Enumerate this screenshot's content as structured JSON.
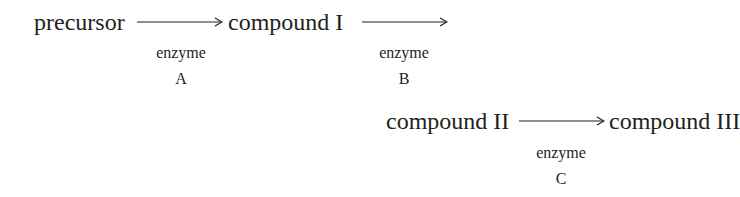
{
  "nodes": {
    "precursor": "precursor",
    "compound_1": "compound I",
    "compound_2": "compound II",
    "compound_3": "compound III"
  },
  "enzymes": {
    "a": {
      "word": "enzyme",
      "letter": "A"
    },
    "b": {
      "word": "enzyme",
      "letter": "B"
    },
    "c": {
      "word": "enzyme",
      "letter": "C"
    }
  }
}
